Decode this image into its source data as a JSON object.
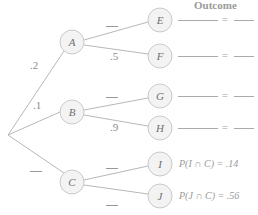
{
  "header": {
    "title": "Outcome"
  },
  "tree": {
    "root": {
      "x": 8,
      "y": 135
    },
    "first_level": [
      {
        "id": "A",
        "label": "A",
        "x": 72,
        "y": 42,
        "prob": ".2"
      },
      {
        "id": "B",
        "label": "B",
        "x": 72,
        "y": 112,
        "prob": ".1"
      },
      {
        "id": "C",
        "label": "C",
        "x": 72,
        "y": 182,
        "prob": "__"
      }
    ],
    "second_level": [
      {
        "id": "E",
        "label": "E",
        "parent": "A",
        "x": 160,
        "y": 20,
        "prob": "__"
      },
      {
        "id": "F",
        "label": "F",
        "parent": "A",
        "x": 160,
        "y": 56,
        "prob": ".5"
      },
      {
        "id": "G",
        "label": "G",
        "parent": "B",
        "x": 160,
        "y": 96,
        "prob": "__"
      },
      {
        "id": "H",
        "label": "H",
        "parent": "B",
        "x": 160,
        "y": 128,
        "prob": ".9"
      },
      {
        "id": "I",
        "label": "I",
        "parent": "C",
        "x": 160,
        "y": 164,
        "prob": "__"
      },
      {
        "id": "J",
        "label": "J",
        "parent": "C",
        "x": 160,
        "y": 196,
        "prob": "__"
      }
    ]
  },
  "labels": {
    "pA": ".2",
    "pB": ".1",
    "pF": ".5",
    "pH": ".9"
  },
  "outcomes": [
    {
      "node": "E",
      "text": "= "
    },
    {
      "node": "F",
      "text": "= "
    },
    {
      "node": "G",
      "text": "= "
    },
    {
      "node": "H",
      "text": "= "
    },
    {
      "node": "I",
      "text": "P(I ∩ C) = .14"
    },
    {
      "node": "J",
      "text": "P(J ∩ C) = .56"
    }
  ],
  "colors": {
    "line": "#b5b5b5",
    "circle_fill": "#f4f4f4",
    "circle_stroke": "#c8c8c8",
    "text": "#8c8c8c"
  }
}
